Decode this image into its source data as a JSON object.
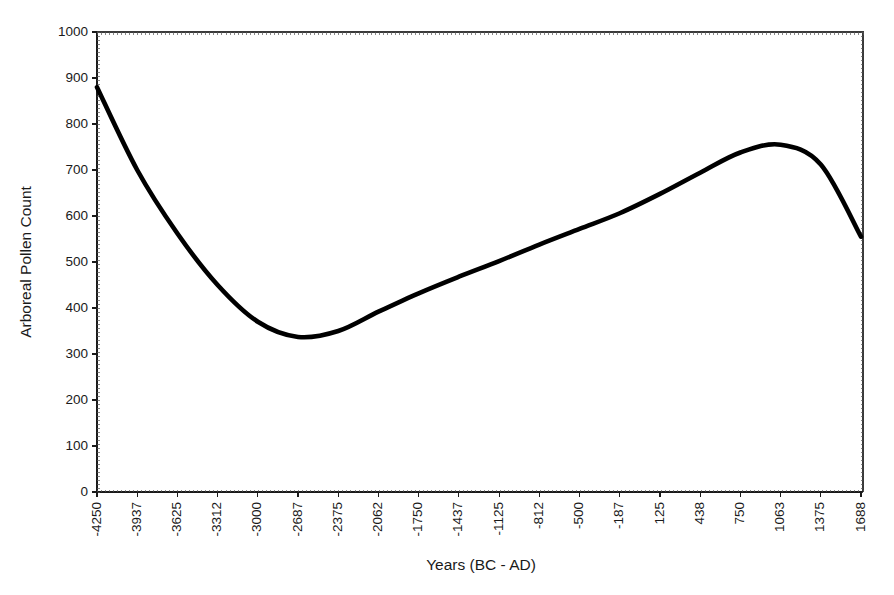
{
  "chart_data": {
    "type": "line",
    "title": "",
    "xlabel": "Years (BC - AD)",
    "ylabel": "Arboreal Pollen Count",
    "grid": false,
    "legend": "none",
    "xlim": [
      -4250,
      1688
    ],
    "ylim": [
      0,
      1000
    ],
    "y_ticks": [
      0,
      100,
      200,
      300,
      400,
      500,
      600,
      700,
      800,
      900,
      1000
    ],
    "x_ticks": [
      -4250,
      -3937,
      -3625,
      -3312,
      -3000,
      -2687,
      -2375,
      -2062,
      -1750,
      -1437,
      -1125,
      -812,
      -500,
      -187,
      125,
      438,
      750,
      1063,
      1375,
      1688
    ],
    "x_tick_labels": [
      "-4250",
      "-3937",
      "-3625",
      "-3312",
      "-3000",
      "-2687",
      "-2375",
      "-2062",
      "-1750",
      "-1437",
      "-1125",
      "-812",
      "-500",
      "-187",
      "125",
      "438",
      "750",
      "1063",
      "1375",
      "1688"
    ],
    "y_tick_labels": [
      "0",
      "100",
      "200",
      "300",
      "400",
      "500",
      "600",
      "700",
      "800",
      "900",
      "1000"
    ],
    "series": [
      {
        "name": "Arboreal Pollen Count",
        "color": "#000000",
        "x": [
          -4250,
          -3937,
          -3625,
          -3312,
          -3000,
          -2687,
          -2375,
          -2062,
          -1750,
          -1437,
          -1125,
          -812,
          -500,
          -187,
          125,
          438,
          750,
          1063,
          1375,
          1688
        ],
        "values": [
          880,
          700,
          562,
          450,
          370,
          337,
          350,
          392,
          432,
          468,
          502,
          538,
          572,
          606,
          648,
          694,
          738,
          755,
          712,
          555
        ]
      }
    ],
    "annotations": [
      {
        "label": "minimum",
        "x": -2687,
        "y": 337
      },
      {
        "label": "maximum",
        "x": 1063,
        "y": 755
      },
      {
        "label": "start",
        "x": -4250,
        "y": 880
      },
      {
        "label": "end",
        "x": 1688,
        "y": 555
      }
    ]
  },
  "axes": {
    "x_title": "Years (BC - AD)",
    "y_title": "Arboreal Pollen Count"
  }
}
